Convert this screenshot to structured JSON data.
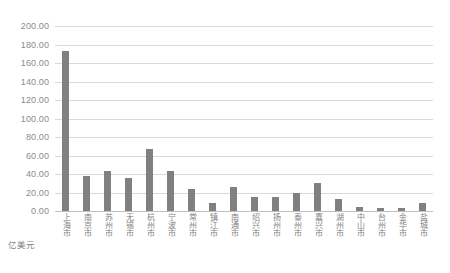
{
  "chart_data": {
    "type": "bar",
    "title": "",
    "xlabel": "",
    "ylabel": "亿美元",
    "unit_label": "亿美元",
    "ylim": [
      0,
      200
    ],
    "ytick_step": 20,
    "grid": true,
    "legend": "none",
    "bar_color": "#808080",
    "grid_color": "#d9d9d9",
    "axis_text_color": "#8c8c8c",
    "yticks": [
      "0.00",
      "20.00",
      "40.00",
      "60.00",
      "80.00",
      "100.00",
      "120.00",
      "140.00",
      "160.00",
      "180.00",
      "200.00"
    ],
    "categories": [
      "上海市",
      "南京市",
      "苏州市",
      "无锡市",
      "杭州市",
      "宁波市",
      "常州市",
      "镇江市",
      "南通市",
      "绍兴市",
      "扬州市",
      "泰州市",
      "嘉兴市",
      "湖州市",
      "中山市",
      "台州市",
      "金华市",
      "盐城市"
    ],
    "values": [
      173.0,
      37.5,
      43.5,
      36.0,
      67.0,
      43.0,
      24.0,
      9.0,
      26.0,
      15.0,
      15.0,
      19.0,
      30.0,
      13.0,
      4.5,
      3.0,
      3.0,
      9.0
    ]
  }
}
